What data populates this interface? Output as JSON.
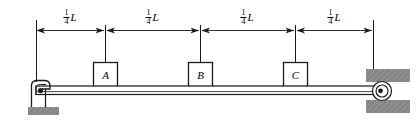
{
  "diagram": {
    "type": "engineering-free-body-diagram",
    "colors": {
      "line": "#1a1a1a",
      "hatch_fill": "#8c8c8c",
      "block_fill": "#ffffff",
      "background": "#ffffff"
    },
    "dimensions": [
      {
        "id": "dim-1",
        "label_numerator": "1",
        "label_denominator": "4",
        "label_symbol": "L",
        "from_x": 36,
        "to_x": 105,
        "label_x": 70
      },
      {
        "id": "dim-2",
        "label_numerator": "1",
        "label_denominator": "4",
        "label_symbol": "L",
        "from_x": 105,
        "to_x": 200,
        "label_x": 152
      },
      {
        "id": "dim-3",
        "label_numerator": "1",
        "label_denominator": "4",
        "label_symbol": "L",
        "from_x": 200,
        "to_x": 295,
        "label_x": 247
      },
      {
        "id": "dim-4",
        "label_numerator": "1",
        "label_denominator": "4",
        "label_symbol": "L",
        "from_x": 295,
        "to_x": 373,
        "label_x": 334
      }
    ],
    "blocks": [
      {
        "id": "block-a",
        "label": "A",
        "center_x": 105,
        "top_y": 62,
        "size": 24
      },
      {
        "id": "block-b",
        "label": "B",
        "center_x": 200,
        "top_y": 62,
        "size": 24
      },
      {
        "id": "block-c",
        "label": "C",
        "center_x": 295,
        "top_y": 62,
        "size": 24
      }
    ],
    "beam": {
      "left_x": 36,
      "right_x": 378,
      "top_y": 86,
      "bottom_y": 95
    },
    "supports": [
      {
        "id": "left-support",
        "kind": "pin-bracket-on-ground",
        "pin_x": 40,
        "pin_y": 91
      },
      {
        "id": "right-support",
        "kind": "pin-between-fixed-blocks",
        "pin_x": 382,
        "pin_y": 91
      }
    ]
  }
}
